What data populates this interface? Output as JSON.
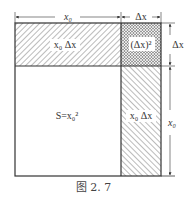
{
  "figure": {
    "caption": "图 2. 7",
    "labels": {
      "top_x0": "x₀",
      "top_dx": "Δx",
      "right_dx": "Δx",
      "right_x0": "x₀",
      "top_rect": "x₀ Δx",
      "corner_square": "(Δx)²",
      "main_square": "S=x₀²",
      "right_rect": "x₀ Δx"
    },
    "colors": {
      "line": "#333333",
      "hatch": "#555555",
      "background": "#ffffff"
    }
  }
}
